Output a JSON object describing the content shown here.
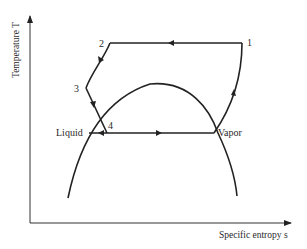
{
  "diagram": {
    "type": "temperature-entropy (T-s) diagram, refrigeration/heat-pump cycle",
    "axes": {
      "y_label": "Temperature T",
      "x_label": "Specific entropy s"
    },
    "states": [
      {
        "id": "1",
        "label": "1"
      },
      {
        "id": "2",
        "label": "2"
      },
      {
        "id": "3",
        "label": "3"
      },
      {
        "id": "4",
        "label": "4"
      }
    ],
    "phase_labels": {
      "liquid": "Liquid",
      "vapor": "Vapor"
    },
    "paths": [
      {
        "from": "1",
        "to": "2",
        "direction": "leftward at constant T"
      },
      {
        "from": "2",
        "to": "3",
        "direction": "down-left curve"
      },
      {
        "from": "3",
        "to": "4",
        "direction": "down-right"
      },
      {
        "from": "Vapor",
        "to": "Liquid",
        "direction": "leftward along saturation line"
      },
      {
        "from": "Vapor",
        "to": "1",
        "direction": "upward curve"
      }
    ],
    "colors": {
      "line": "#222222",
      "text": "#2a2a2a",
      "background": "#ffffff"
    }
  }
}
